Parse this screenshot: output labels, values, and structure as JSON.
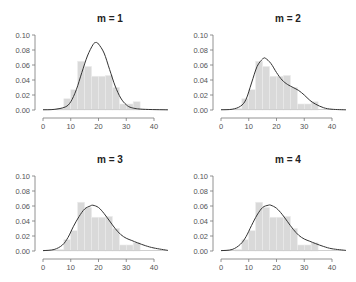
{
  "chart_data": [
    {
      "type": "bar",
      "title": "m = 1",
      "xlabel": "",
      "ylabel": "",
      "xlim": [
        0,
        45
      ],
      "ylim": [
        0,
        0.1
      ],
      "xticks": [
        0,
        10,
        20,
        30,
        40
      ],
      "yticks": [
        "0.00",
        "0.02",
        "0.04",
        "0.06",
        "0.08",
        "0.10"
      ],
      "bins": [
        0,
        2.5,
        5,
        7.5,
        10,
        12.5,
        15,
        17.5,
        20,
        22.5,
        25,
        27.5,
        30,
        32.5,
        35,
        37.5,
        40,
        42.5
      ],
      "histogram": [
        0.0,
        0.001,
        0.002,
        0.015,
        0.027,
        0.065,
        0.058,
        0.045,
        0.045,
        0.046,
        0.03,
        0.008,
        0.008,
        0.011,
        0.001,
        0.001,
        0.001
      ],
      "density_curve": {
        "shape": "normal",
        "mean": 19,
        "peak": 0.09
      },
      "grid": false
    },
    {
      "type": "bar",
      "title": "m = 2",
      "xlabel": "",
      "ylabel": "",
      "xlim": [
        0,
        45
      ],
      "ylim": [
        0,
        0.1
      ],
      "xticks": [
        0,
        10,
        20,
        30,
        40
      ],
      "yticks": [
        "0.00",
        "0.02",
        "0.04",
        "0.06",
        "0.08",
        "0.10"
      ],
      "bins": [
        0,
        2.5,
        5,
        7.5,
        10,
        12.5,
        15,
        17.5,
        20,
        22.5,
        25,
        27.5,
        30,
        32.5,
        35,
        37.5,
        40,
        42.5
      ],
      "histogram": [
        0.0,
        0.001,
        0.002,
        0.015,
        0.027,
        0.065,
        0.058,
        0.045,
        0.045,
        0.046,
        0.03,
        0.008,
        0.008,
        0.011,
        0.001,
        0.001,
        0.001
      ],
      "density_curve": {
        "shape": "bimodal-right-skew",
        "mode": 15.5,
        "peak": 0.069,
        "shoulder": {
          "x": 27,
          "y": 0.027
        }
      },
      "grid": false
    },
    {
      "type": "bar",
      "title": "m = 3",
      "xlabel": "",
      "ylabel": "",
      "xlim": [
        0,
        45
      ],
      "ylim": [
        0,
        0.1
      ],
      "xticks": [
        0,
        10,
        20,
        30,
        40
      ],
      "yticks": [
        "0.00",
        "0.02",
        "0.04",
        "0.06",
        "0.08",
        "0.10"
      ],
      "bins": [
        0,
        2.5,
        5,
        7.5,
        10,
        12.5,
        15,
        17.5,
        20,
        22.5,
        25,
        27.5,
        30,
        32.5,
        35,
        37.5,
        40,
        42.5
      ],
      "histogram": [
        0.0,
        0.001,
        0.002,
        0.015,
        0.027,
        0.065,
        0.058,
        0.045,
        0.045,
        0.046,
        0.03,
        0.008,
        0.008,
        0.011,
        0.001,
        0.001,
        0.001
      ],
      "density_curve": {
        "shape": "right-skew",
        "mode": 18,
        "peak": 0.061
      },
      "grid": false
    },
    {
      "type": "bar",
      "title": "m = 4",
      "xlabel": "",
      "ylabel": "",
      "xlim": [
        0,
        45
      ],
      "ylim": [
        0,
        0.1
      ],
      "xticks": [
        0,
        10,
        20,
        30,
        40
      ],
      "yticks": [
        "0.00",
        "0.02",
        "0.04",
        "0.06",
        "0.08",
        "0.10"
      ],
      "bins": [
        0,
        2.5,
        5,
        7.5,
        10,
        12.5,
        15,
        17.5,
        20,
        22.5,
        25,
        27.5,
        30,
        32.5,
        35,
        37.5,
        40,
        42.5
      ],
      "histogram": [
        0.0,
        0.001,
        0.002,
        0.015,
        0.027,
        0.065,
        0.058,
        0.045,
        0.045,
        0.046,
        0.03,
        0.008,
        0.008,
        0.011,
        0.001,
        0.001,
        0.001
      ],
      "density_curve": {
        "shape": "right-skew",
        "mode": 17.5,
        "peak": 0.061
      },
      "grid": false
    }
  ],
  "panels": [
    {
      "title": "m = 1",
      "ox": 0,
      "oy": 0,
      "curve": [
        [
          0,
          0.0003
        ],
        [
          4,
          0.0008
        ],
        [
          8,
          0.004
        ],
        [
          10,
          0.011
        ],
        [
          12,
          0.027
        ],
        [
          14,
          0.05
        ],
        [
          16,
          0.072
        ],
        [
          18,
          0.087
        ],
        [
          19,
          0.09
        ],
        [
          20,
          0.088
        ],
        [
          22,
          0.076
        ],
        [
          24,
          0.054
        ],
        [
          26,
          0.032
        ],
        [
          28,
          0.016
        ],
        [
          30,
          0.007
        ],
        [
          32,
          0.003
        ],
        [
          36,
          0.001
        ],
        [
          45,
          0.0002
        ]
      ]
    },
    {
      "title": "m = 2",
      "ox": 178,
      "oy": 0,
      "curve": [
        [
          0,
          0.0003
        ],
        [
          4,
          0.001
        ],
        [
          7,
          0.005
        ],
        [
          9,
          0.014
        ],
        [
          11,
          0.036
        ],
        [
          13,
          0.058
        ],
        [
          15,
          0.068
        ],
        [
          16,
          0.069
        ],
        [
          18,
          0.062
        ],
        [
          20,
          0.05
        ],
        [
          22,
          0.04
        ],
        [
          24,
          0.034
        ],
        [
          26,
          0.03
        ],
        [
          28,
          0.026
        ],
        [
          30,
          0.02
        ],
        [
          32,
          0.013
        ],
        [
          34,
          0.008
        ],
        [
          37,
          0.003
        ],
        [
          40,
          0.001
        ],
        [
          45,
          0.0002
        ]
      ]
    },
    {
      "title": "m = 3",
      "ox": 0,
      "oy": 141,
      "curve": [
        [
          0,
          0.0005
        ],
        [
          4,
          0.002
        ],
        [
          7,
          0.008
        ],
        [
          9,
          0.018
        ],
        [
          11,
          0.033
        ],
        [
          13,
          0.046
        ],
        [
          15,
          0.056
        ],
        [
          17,
          0.06
        ],
        [
          18,
          0.061
        ],
        [
          20,
          0.058
        ],
        [
          22,
          0.05
        ],
        [
          24,
          0.04
        ],
        [
          26,
          0.03
        ],
        [
          28,
          0.022
        ],
        [
          30,
          0.017
        ],
        [
          32,
          0.014
        ],
        [
          34,
          0.011
        ],
        [
          37,
          0.007
        ],
        [
          40,
          0.004
        ],
        [
          45,
          0.0008
        ]
      ]
    },
    {
      "title": "m = 4",
      "ox": 178,
      "oy": 141,
      "curve": [
        [
          0,
          0.0005
        ],
        [
          4,
          0.002
        ],
        [
          7,
          0.009
        ],
        [
          9,
          0.019
        ],
        [
          11,
          0.034
        ],
        [
          13,
          0.048
        ],
        [
          15,
          0.058
        ],
        [
          17,
          0.061
        ],
        [
          18,
          0.061
        ],
        [
          20,
          0.057
        ],
        [
          22,
          0.049
        ],
        [
          24,
          0.039
        ],
        [
          26,
          0.029
        ],
        [
          28,
          0.021
        ],
        [
          30,
          0.016
        ],
        [
          32,
          0.013
        ],
        [
          34,
          0.01
        ],
        [
          37,
          0.006
        ],
        [
          40,
          0.003
        ],
        [
          45,
          0.0008
        ]
      ]
    }
  ]
}
